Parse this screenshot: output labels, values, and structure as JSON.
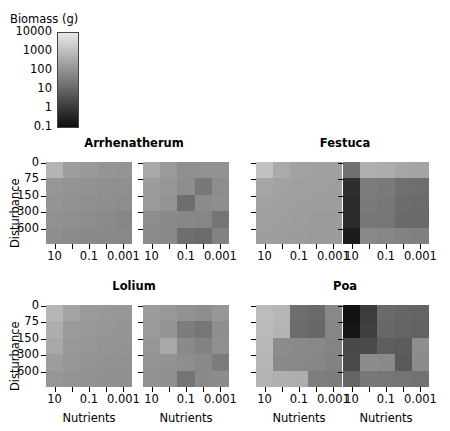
{
  "legend": {
    "title": "Biomass (g)",
    "ticks": [
      "10000",
      "1000",
      "100",
      "10",
      "1",
      "0.1"
    ],
    "gradient_light": "#e9e9e9",
    "gradient_dark": "#0d0d0d"
  },
  "axes": {
    "ylabel": "Disturbance",
    "yticks": [
      "0",
      "75",
      "150",
      "300",
      "600"
    ],
    "xlabel": "Nutrients",
    "xticks": [
      "10",
      "0.1",
      "0.001"
    ]
  },
  "chart_data": {
    "type": "heatmap",
    "title": "",
    "xlabel": "Nutrients",
    "ylabel": "Disturbance",
    "colorbar_label": "Biomass (g)",
    "colorbar_ticks": [
      10000,
      1000,
      100,
      10,
      1,
      0.1
    ],
    "colorbar_scale": "log",
    "grid": false,
    "legend_position": "top-left",
    "x_categories": [
      "10",
      "1",
      "0.1",
      "0.01",
      "0.001"
    ],
    "y_categories": [
      "0",
      "75",
      "150",
      "300",
      "600"
    ],
    "species": [
      "Arrhenatherum",
      "Festuca",
      "Lolium",
      "Poa"
    ],
    "panels_per_species": 2,
    "panels": [
      {
        "species": "Arrhenatherum",
        "replicate": 1,
        "row": 0,
        "col": 0,
        "values": [
          [
            "#b4b4b4",
            "#9e9e9e",
            "#999999",
            "#959595",
            "#949494"
          ],
          [
            "#969696",
            "#949494",
            "#929292",
            "#909090",
            "#8f8f8f"
          ],
          [
            "#949494",
            "#929292",
            "#8f8f8f",
            "#8e8e8e",
            "#8d8d8d"
          ],
          [
            "#919191",
            "#8f8f8f",
            "#8d8d8d",
            "#8b8b8b",
            "#868686"
          ],
          [
            "#8d8d8d",
            "#8b8b8b",
            "#8a8a8a",
            "#898989",
            "#888888"
          ]
        ]
      },
      {
        "species": "Arrhenatherum",
        "replicate": 2,
        "row": 0,
        "col": 1,
        "values": [
          [
            "#a8a8a8",
            "#9a9a9a",
            "#8f8f8f",
            "#919191",
            "#929292"
          ],
          [
            "#9c9c9c",
            "#969696",
            "#8d8d8d",
            "#787878",
            "#8d8d8d"
          ],
          [
            "#9a9a9a",
            "#949494",
            "#6e6e6e",
            "#8c8c8c",
            "#8e8e8e"
          ],
          [
            "#8d8d8d",
            "#8a8a8a",
            "#878787",
            "#868686",
            "#747474"
          ],
          [
            "#8b8b8b",
            "#898989",
            "#6f6f6f",
            "#6b6b6b",
            "#828282"
          ]
        ]
      },
      {
        "species": "Festuca",
        "replicate": 1,
        "row": 0,
        "col": 2,
        "values": [
          [
            "#c2c2c2",
            "#ababab",
            "#a2a2a2",
            "#a0a0a0",
            "#a0a0a0"
          ],
          [
            "#a6a6a6",
            "#a2a2a2",
            "#a0a0a0",
            "#9f9f9f",
            "#9e9e9e"
          ],
          [
            "#a2a2a2",
            "#a0a0a0",
            "#9e9e9e",
            "#9d9d9d",
            "#9d9d9d"
          ],
          [
            "#a0a0a0",
            "#9e9e9e",
            "#9d9d9d",
            "#9c9c9c",
            "#9c9c9c"
          ],
          [
            "#9e9e9e",
            "#9d9d9d",
            "#9c9c9c",
            "#9b9b9b",
            "#9b9b9b"
          ]
        ]
      },
      {
        "species": "Festuca",
        "replicate": 2,
        "row": 0,
        "col": 3,
        "values": [
          [
            "#707070",
            "#b0b0b0",
            "#acacac",
            "#a6a6a6",
            "#a4a4a4"
          ],
          [
            "#2e2e2e",
            "#7c7c7c",
            "#7a7a7a",
            "#707070",
            "#6e6e6e"
          ],
          [
            "#2b2b2b",
            "#7a7a7a",
            "#787878",
            "#6c6c6c",
            "#6b6b6b"
          ],
          [
            "#2a2a2a",
            "#787878",
            "#767676",
            "#6a6a6a",
            "#696969"
          ],
          [
            "#1c1c1c",
            "#888888",
            "#868686",
            "#828282",
            "#808080"
          ]
        ]
      },
      {
        "species": "Lolium",
        "replicate": 1,
        "row": 1,
        "col": 0,
        "values": [
          [
            "#b6b6b6",
            "#a4a4a4",
            "#9a9a9a",
            "#989898",
            "#979797"
          ],
          [
            "#aeaeae",
            "#9a9a9a",
            "#989898",
            "#969696",
            "#959595"
          ],
          [
            "#a8a8a8",
            "#989898",
            "#969696",
            "#949494",
            "#939393"
          ],
          [
            "#9d9d9d",
            "#969696",
            "#949494",
            "#929292",
            "#919191"
          ],
          [
            "#969696",
            "#949494",
            "#929292",
            "#909090",
            "#909090"
          ]
        ]
      },
      {
        "species": "Lolium",
        "replicate": 2,
        "row": 1,
        "col": 1,
        "values": [
          [
            "#9c9c9c",
            "#989898",
            "#929292",
            "#8d8d8d",
            "#969696"
          ],
          [
            "#9a9a9a",
            "#949494",
            "#7c7c7c",
            "#767676",
            "#8e8e8e"
          ],
          [
            "#969696",
            "#a8a8a8",
            "#8a8a8a",
            "#828282",
            "#909090"
          ],
          [
            "#949494",
            "#929292",
            "#8e8e8e",
            "#8a8a8a",
            "#7c7c7c"
          ],
          [
            "#929292",
            "#909090",
            "#747474",
            "#8a8a8a",
            "#8c8c8c"
          ]
        ]
      },
      {
        "species": "Poa",
        "replicate": 1,
        "row": 1,
        "col": 2,
        "values": [
          [
            "#bcbcbc",
            "#b6b6b6",
            "#6e6e6e",
            "#6a6a6a",
            "#888888"
          ],
          [
            "#bababa",
            "#b4b4b4",
            "#6c6c6c",
            "#686868",
            "#868686"
          ],
          [
            "#b8b8b8",
            "#8c8c8c",
            "#8a8a8a",
            "#888888",
            "#848484"
          ],
          [
            "#b6b6b6",
            "#8a8a8a",
            "#888888",
            "#868686",
            "#828282"
          ],
          [
            "#b4b4b4",
            "#b0b0b0",
            "#aeaeae",
            "#7e7e7e",
            "#7c7c7c"
          ]
        ]
      },
      {
        "species": "Poa",
        "replicate": 2,
        "row": 1,
        "col": 3,
        "values": [
          [
            "#121212",
            "#3c3c3c",
            "#6a6a6a",
            "#666666",
            "#646464"
          ],
          [
            "#161616",
            "#404040",
            "#686868",
            "#646464",
            "#626262"
          ],
          [
            "#484848",
            "#4a4a4a",
            "#5e5e5e",
            "#5c5c5c",
            "#8e8e8e"
          ],
          [
            "#4a4a4a",
            "#8c8c8c",
            "#8a8a8a",
            "#5a5a5a",
            "#8c8c8c"
          ],
          [
            "#646464",
            "#787878",
            "#767676",
            "#747474",
            "#727272"
          ]
        ]
      }
    ]
  }
}
